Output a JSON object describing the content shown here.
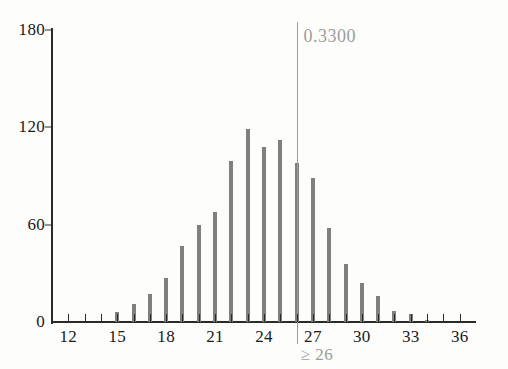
{
  "chart_data": {
    "type": "bar",
    "title": "",
    "subtitle": "",
    "xlabel": "",
    "ylabel": "",
    "xlim": [
      11,
      37
    ],
    "ylim": [
      0,
      180
    ],
    "grid": false,
    "legend": null,
    "y_ticks": [
      0,
      60,
      120,
      180
    ],
    "y_tick_labels": [
      "0",
      "60",
      "120",
      "180"
    ],
    "x_ticks": [
      12,
      13,
      14,
      15,
      16,
      17,
      18,
      19,
      20,
      21,
      22,
      23,
      24,
      25,
      26,
      27,
      28,
      29,
      30,
      31,
      32,
      33,
      34,
      35,
      36
    ],
    "x_tick_labels": [
      {
        "value": 12,
        "label": "12"
      },
      {
        "value": 15,
        "label": "15"
      },
      {
        "value": 18,
        "label": "18"
      },
      {
        "value": 21,
        "label": "21"
      },
      {
        "value": 24,
        "label": "24"
      },
      {
        "value": 27,
        "label": "27"
      },
      {
        "value": 30,
        "label": "30"
      },
      {
        "value": 33,
        "label": "33"
      },
      {
        "value": 36,
        "label": "36"
      }
    ],
    "categories": [
      12,
      13,
      14,
      15,
      16,
      17,
      18,
      19,
      20,
      21,
      22,
      23,
      24,
      25,
      26,
      27,
      28,
      29,
      30,
      31,
      32,
      33,
      34
    ],
    "values": [
      0,
      0,
      0,
      6,
      11,
      17,
      27,
      47,
      60,
      68,
      99,
      119,
      108,
      112,
      98,
      89,
      58,
      36,
      24,
      16,
      7,
      5,
      1
    ],
    "bar_color": "#7f7f7f",
    "annotations": [
      {
        "name": "cutoff-marker",
        "x": 26,
        "value_label": "0.3300",
        "caption": "≥ 26",
        "color": "#9c9c9c"
      }
    ]
  },
  "annotation": {
    "probability": "0.3300",
    "condition": "≥ 26"
  },
  "colors": {
    "bar": "#7f7f7f",
    "axis": "#2b2b2b",
    "annotation": "#9c9c9c",
    "background": "#fdfdfc"
  }
}
